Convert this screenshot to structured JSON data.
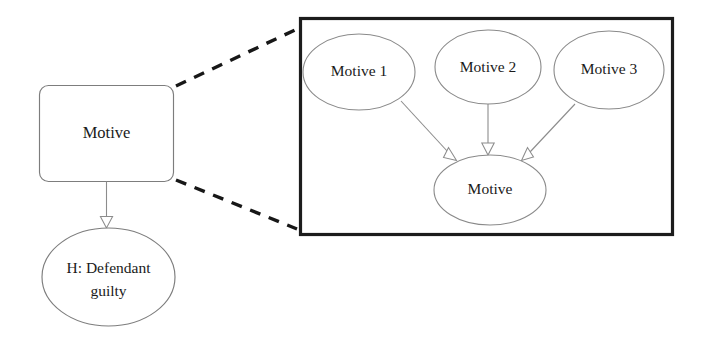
{
  "diagram": {
    "background_color": "#ffffff",
    "stroke_color": "#8c8c8c",
    "panel_border_color": "#1c1c1c",
    "text_color": "#1a1a1a",
    "left_graph": {
      "nodes": [
        {
          "id": "motive-parent",
          "label": "Motive",
          "shape": "rounded-rectangle"
        },
        {
          "id": "hypothesis",
          "label_line1": "H: Defendant",
          "label_line2": "guilty",
          "shape": "ellipse"
        }
      ],
      "edges": [
        {
          "id": "motive-to-hypothesis",
          "from": "motive-parent",
          "to": "hypothesis",
          "style": "solid",
          "arrow": "hollow-triangle"
        }
      ]
    },
    "zoom_connectors": [
      {
        "id": "zoom-connector-top",
        "style": "dashed"
      },
      {
        "id": "zoom-connector-bottom",
        "style": "dashed"
      }
    ],
    "detail_panel": {
      "id": "detail-panel",
      "nodes": [
        {
          "id": "motive-1",
          "label": "Motive 1",
          "shape": "ellipse"
        },
        {
          "id": "motive-2",
          "label": "Motive 2",
          "shape": "ellipse"
        },
        {
          "id": "motive-3",
          "label": "Motive 3",
          "shape": "ellipse"
        },
        {
          "id": "motive-child",
          "label": "Motive",
          "shape": "ellipse"
        }
      ],
      "edges": [
        {
          "id": "motive1-to-motive",
          "from": "motive-1",
          "to": "motive-child",
          "style": "solid",
          "arrow": "hollow-triangle"
        },
        {
          "id": "motive2-to-motive",
          "from": "motive-2",
          "to": "motive-child",
          "style": "solid",
          "arrow": "hollow-triangle"
        },
        {
          "id": "motive3-to-motive",
          "from": "motive-3",
          "to": "motive-child",
          "style": "solid",
          "arrow": "hollow-triangle"
        }
      ]
    }
  }
}
